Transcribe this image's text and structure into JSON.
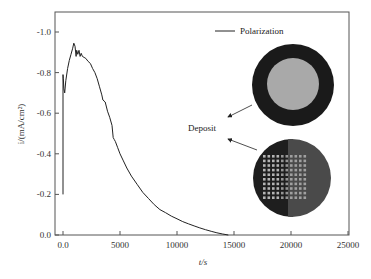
{
  "chart_data": {
    "type": "line",
    "title": "",
    "xlabel": "t/s",
    "ylabel": "i/(mA/cm²)",
    "xlim": [
      -1500,
      25000
    ],
    "ylim": [
      0.0,
      -1.1
    ],
    "x_ticks": [
      0,
      5000,
      10000,
      15000,
      20000,
      25000
    ],
    "x_tick_labels": [
      "0.0",
      "5000",
      "10000",
      "15000",
      "20000",
      "25000"
    ],
    "y_ticks": [
      0.0,
      -0.2,
      -0.4,
      -0.6,
      -0.8,
      -1.0
    ],
    "y_tick_labels": [
      "0.0",
      "-0.2",
      "-0.4",
      "-0.6",
      "-0.8",
      "-1.0"
    ],
    "grid": false,
    "legend_position": "upper right",
    "series": [
      {
        "name": "Polarization",
        "color": "#222222",
        "x": [
          0,
          0,
          30,
          80,
          150,
          250,
          400,
          550,
          700,
          850,
          950,
          1050,
          1150,
          1200,
          1300,
          1400,
          1500,
          1600,
          1700,
          1850,
          2000,
          2200,
          2400,
          2600,
          2800,
          3000,
          3200,
          3400,
          3500,
          3700,
          3900,
          4100,
          4300,
          4400,
          4500,
          4600,
          4800,
          5000,
          5300,
          5600,
          6000,
          6500,
          7000,
          7500,
          8000,
          8500,
          9000,
          9500,
          10000,
          10500,
          11000,
          11500,
          12000,
          12500,
          13000,
          13500,
          14000,
          14500
        ],
        "y": [
          -0.2,
          -0.79,
          -0.77,
          -0.72,
          -0.7,
          -0.76,
          -0.82,
          -0.86,
          -0.89,
          -0.92,
          -0.945,
          -0.93,
          -0.88,
          -0.91,
          -0.89,
          -0.91,
          -0.88,
          -0.895,
          -0.88,
          -0.875,
          -0.87,
          -0.855,
          -0.845,
          -0.82,
          -0.8,
          -0.77,
          -0.73,
          -0.69,
          -0.665,
          -0.655,
          -0.61,
          -0.58,
          -0.54,
          -0.48,
          -0.47,
          -0.46,
          -0.43,
          -0.4,
          -0.365,
          -0.33,
          -0.29,
          -0.25,
          -0.21,
          -0.18,
          -0.15,
          -0.125,
          -0.11,
          -0.093,
          -0.08,
          -0.066,
          -0.055,
          -0.045,
          -0.035,
          -0.026,
          -0.018,
          -0.011,
          -0.005,
          0.0
        ]
      }
    ],
    "annotations": [
      {
        "text": "Deposit",
        "type": "label"
      },
      {
        "text": "",
        "type": "arrow",
        "target": "top-sample-image"
      },
      {
        "text": "",
        "type": "arrow",
        "target": "bottom-sample-image"
      }
    ],
    "inset_images": [
      {
        "name": "sample-substrate",
        "description": "dark ring with lighter gray disc center"
      },
      {
        "name": "sample-deposit-array",
        "description": "dark circular sample with ~10x10 grid of light square dots"
      }
    ]
  },
  "labels": {
    "legend": "Polarization",
    "deposit": "Deposit",
    "xlabel": "t/s",
    "ylabel": "i/(mA/cm²)"
  },
  "colors": {
    "axis": "#555555",
    "line": "#222222",
    "ring": "#1a1a1a",
    "disc": "#a9a9a9",
    "sample_dark": "#1e1e1e",
    "sample_light": "#4a4a4a",
    "dot": "#bdbdbd"
  }
}
